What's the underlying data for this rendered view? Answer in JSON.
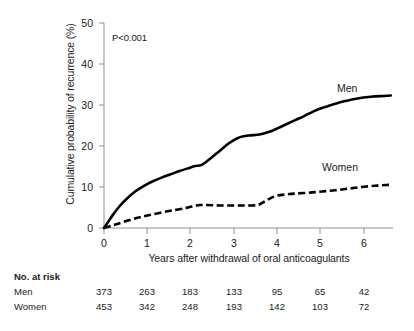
{
  "chart_data": {
    "type": "line",
    "title": "",
    "xlabel": "Years after withdrawal of oral anticoagulants",
    "ylabel": "Cumulative probability of recurrence (%)",
    "xlim": [
      0,
      6.5
    ],
    "ylim": [
      0,
      50
    ],
    "xticks": [
      "0",
      "1",
      "2",
      "3",
      "4",
      "5",
      "6"
    ],
    "xtick_values": [
      0,
      1,
      2,
      3,
      4,
      5,
      6
    ],
    "yticks": [
      "0",
      "10",
      "20",
      "30",
      "40",
      "50"
    ],
    "ytick_values": [
      0,
      10,
      20,
      30,
      40,
      50
    ],
    "grid": false,
    "legend_position": "inline-right",
    "annotations": [
      {
        "name": "p-value",
        "text": "P<0.001",
        "x": 0.33,
        "y": 45.5
      }
    ],
    "series": [
      {
        "name": "Men",
        "style": "solid",
        "color": "#000000",
        "x": [
          0,
          0.1,
          0.2,
          0.35,
          0.5,
          0.7,
          0.9,
          1.1,
          1.3,
          1.5,
          1.7,
          1.9,
          2.05,
          2.2,
          2.4,
          2.6,
          2.8,
          3.0,
          3.15,
          3.3,
          3.5,
          3.7,
          3.9,
          4.1,
          4.3,
          4.5,
          4.7,
          4.85,
          5.0,
          5.2,
          5.4,
          5.7,
          6.0,
          6.3,
          6.45
        ],
        "y": [
          0,
          1.6,
          3.2,
          5.3,
          7.0,
          8.9,
          10.3,
          11.4,
          12.3,
          13.1,
          13.9,
          14.6,
          15.1,
          15.4,
          17.0,
          18.8,
          20.6,
          21.9,
          22.4,
          22.6,
          22.8,
          23.4,
          24.3,
          25.3,
          26.3,
          27.3,
          28.4,
          29.1,
          29.6,
          30.3,
          30.9,
          31.6,
          32.0,
          32.2,
          32.3
        ]
      },
      {
        "name": "Women",
        "style": "dashed",
        "color": "#000000",
        "x": [
          0,
          0.15,
          0.3,
          0.5,
          0.75,
          1.0,
          1.3,
          1.6,
          1.85,
          2.05,
          2.15,
          2.3,
          2.6,
          2.9,
          3.2,
          3.45,
          3.6,
          3.75,
          3.9,
          4.1,
          4.3,
          4.6,
          4.9,
          5.2,
          5.5,
          5.8,
          6.1,
          6.35,
          6.45
        ],
        "y": [
          0,
          0.5,
          1.0,
          1.7,
          2.5,
          3.1,
          3.8,
          4.4,
          4.9,
          5.4,
          5.6,
          5.6,
          5.5,
          5.5,
          5.5,
          5.6,
          6.4,
          7.3,
          7.9,
          8.2,
          8.4,
          8.6,
          8.9,
          9.2,
          9.6,
          10.0,
          10.3,
          10.5,
          10.5
        ]
      }
    ]
  },
  "series_labels": {
    "men": "Men",
    "women": "Women"
  },
  "risk_table": {
    "title": "No. at risk",
    "rows": [
      {
        "label": "Men",
        "values": [
          "373",
          "263",
          "183",
          "133",
          "95",
          "65",
          "42"
        ]
      },
      {
        "label": "Women",
        "values": [
          "453",
          "342",
          "248",
          "193",
          "142",
          "103",
          "72"
        ]
      }
    ]
  }
}
